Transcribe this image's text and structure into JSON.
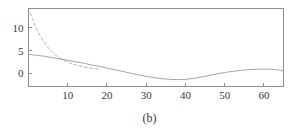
{
  "figure": {
    "caption": "(b)",
    "background_color": "#ffffff",
    "axis_color": "#8e8e8e",
    "text_color": "#3a3a3a"
  },
  "chart_data": {
    "type": "line",
    "title": "",
    "xlabel": "",
    "ylabel": "",
    "xlim": [
      0,
      65
    ],
    "ylim": [
      -2.8,
      14.2
    ],
    "grid": false,
    "legend": "none",
    "xticks": [
      10,
      20,
      30,
      40,
      50,
      60
    ],
    "xtick_labels": [
      "10",
      "20",
      "30",
      "40",
      "50",
      "60"
    ],
    "yticks": [
      0,
      5,
      10
    ],
    "ytick_labels": [
      "0",
      "5",
      "10"
    ],
    "series": [
      {
        "name": "dashed-decay",
        "style": "dashed",
        "color": "#a8a8a8",
        "x": [
          0.4,
          1,
          2,
          3,
          4,
          5,
          6,
          7,
          8,
          9,
          10,
          11,
          12,
          13,
          14,
          15,
          16,
          17,
          18
        ],
        "y": [
          13.2,
          12.0,
          9.9,
          8.2,
          6.8,
          5.7,
          4.8,
          4.0,
          3.4,
          2.9,
          2.5,
          2.2,
          1.9,
          1.7,
          1.5,
          1.35,
          1.2,
          1.1,
          1.0
        ]
      },
      {
        "name": "solid-response",
        "style": "solid",
        "color": "#9a9a9a",
        "x": [
          0,
          2,
          4,
          6,
          8,
          10,
          12,
          14,
          16,
          18,
          20,
          22,
          24,
          26,
          28,
          30,
          32,
          34,
          36,
          38,
          40,
          42,
          44,
          46,
          48,
          50,
          52,
          54,
          56,
          58,
          60,
          62,
          64,
          65
        ],
        "y": [
          4.2,
          4.0,
          3.8,
          3.5,
          3.2,
          2.9,
          2.6,
          2.3,
          1.9,
          1.6,
          1.2,
          0.85,
          0.5,
          0.1,
          -0.25,
          -0.6,
          -0.85,
          -1.1,
          -1.25,
          -1.3,
          -1.25,
          -1.05,
          -0.75,
          -0.4,
          -0.05,
          0.25,
          0.5,
          0.7,
          0.85,
          0.95,
          1.0,
          0.95,
          0.75,
          0.55
        ]
      }
    ]
  }
}
